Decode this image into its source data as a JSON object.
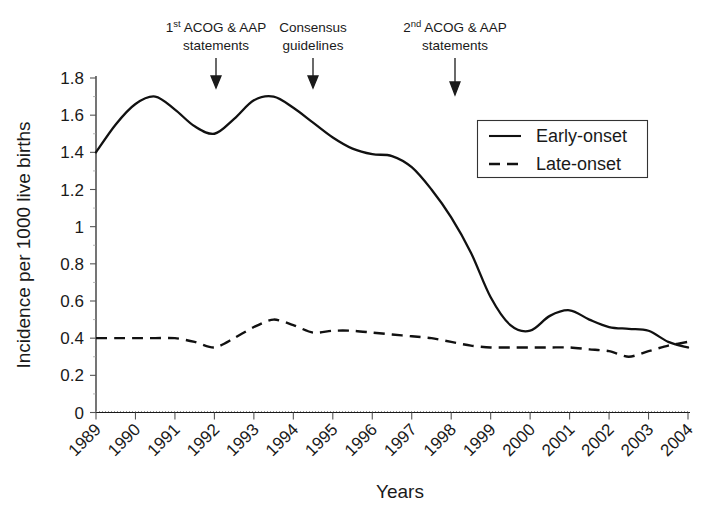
{
  "chart_data": {
    "type": "line",
    "title": "",
    "xlabel": "Years",
    "ylabel": "Incidence per 1000 live births",
    "xlim": [
      1989,
      2004
    ],
    "ylim": [
      0,
      1.8
    ],
    "ytick_step": 0.2,
    "grid": false,
    "legend_position": "upper-right",
    "categories": [
      "1989",
      "1990",
      "1991",
      "1992",
      "1993",
      "1994",
      "1995",
      "1996",
      "1997",
      "1998",
      "1999",
      "2000",
      "2001",
      "2002",
      "2003",
      "2004"
    ],
    "ytick_labels": [
      "0",
      "0.2",
      "0.4",
      "0.6",
      "0.8",
      "1",
      "1.2",
      "1.4",
      "1.6",
      "1.8"
    ],
    "ytick_values": [
      0,
      0.2,
      0.4,
      0.6,
      0.8,
      1,
      1.2,
      1.4,
      1.6,
      1.8
    ],
    "series": [
      {
        "name": "Early-onset",
        "style": "solid",
        "x": [
          1989,
          1989.5,
          1990,
          1990.5,
          1991,
          1991.5,
          1992,
          1992.5,
          1993,
          1993.5,
          1994,
          1994.5,
          1995,
          1995.5,
          1996,
          1996.5,
          1997,
          1997.5,
          1998,
          1998.5,
          1999,
          1999.5,
          2000,
          2000.5,
          2001,
          2001.5,
          2002,
          2002.5,
          2003,
          2003.5,
          2004
        ],
        "values": [
          1.4,
          1.55,
          1.66,
          1.7,
          1.63,
          1.54,
          1.5,
          1.58,
          1.68,
          1.7,
          1.64,
          1.56,
          1.48,
          1.42,
          1.39,
          1.38,
          1.32,
          1.2,
          1.05,
          0.86,
          0.62,
          0.47,
          0.44,
          0.52,
          0.55,
          0.5,
          0.46,
          0.45,
          0.44,
          0.38,
          0.35
        ]
      },
      {
        "name": "Late-onset",
        "style": "dashed",
        "x": [
          1989,
          1989.5,
          1990,
          1990.5,
          1991,
          1991.5,
          1992,
          1992.5,
          1993,
          1993.5,
          1994,
          1994.5,
          1995,
          1995.5,
          1996,
          1996.5,
          1997,
          1997.5,
          1998,
          1998.5,
          1999,
          1999.5,
          2000,
          2000.5,
          2001,
          2001.5,
          2002,
          2002.5,
          2003,
          2003.5,
          2004
        ],
        "values": [
          0.4,
          0.4,
          0.4,
          0.4,
          0.4,
          0.38,
          0.35,
          0.4,
          0.46,
          0.5,
          0.47,
          0.43,
          0.44,
          0.44,
          0.43,
          0.42,
          0.41,
          0.4,
          0.38,
          0.36,
          0.35,
          0.35,
          0.35,
          0.35,
          0.35,
          0.34,
          0.33,
          0.3,
          0.33,
          0.36,
          0.38
        ]
      }
    ],
    "annotations": [
      {
        "id": "first-acog-aap",
        "line1_pre": "1",
        "line1_sup": "st",
        "line1_post": " ACOG & AAP",
        "line2": "statements",
        "x": 1992.0,
        "text_full": "1st ACOG & AAP statements"
      },
      {
        "id": "consensus-guidelines",
        "line1_pre": "Consensus",
        "line1_sup": "",
        "line1_post": "",
        "line2": "guidelines",
        "x": 1994.5,
        "text_full": "Consensus guidelines"
      },
      {
        "id": "second-acog-aap",
        "line1_pre": "2",
        "line1_sup": "nd",
        "line1_post": " ACOG & AAP",
        "line2": "statements",
        "x": 1998.3,
        "text_full": "2nd ACOG & AAP statements"
      }
    ],
    "legend": [
      {
        "label": "Early-onset",
        "style": "solid"
      },
      {
        "label": "Late-onset",
        "style": "dashed"
      }
    ],
    "colors": {
      "series": "#111111",
      "axis": "#1a1a1a",
      "text": "#1a1a1a",
      "background": "#ffffff"
    }
  }
}
